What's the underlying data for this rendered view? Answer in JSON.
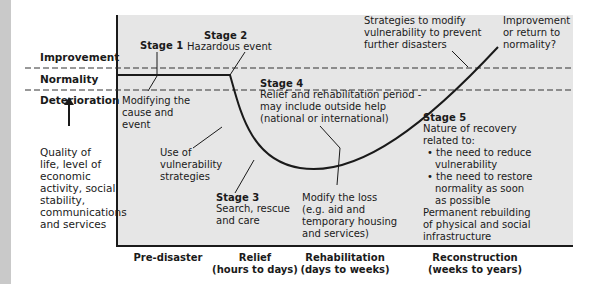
{
  "y_axis": {
    "bands": [
      "Improvement",
      "Normality",
      "Deterioration"
    ],
    "indicator_label": [
      "Quality of",
      "life, level of",
      "economic",
      "activity, social",
      "stability,",
      "communications",
      "and services"
    ]
  },
  "x_axis": {
    "phases": [
      {
        "name": "Pre-disaster",
        "span": ""
      },
      {
        "name": "Relief",
        "span": "(hours to days)"
      },
      {
        "name": "Rehabilitation",
        "span": "(days to weeks)"
      },
      {
        "name": "Reconstruction",
        "span": "(weeks to years)"
      }
    ]
  },
  "stages": {
    "stage1": {
      "title": "Stage 1",
      "text": [
        "Modifying the",
        "cause and",
        "event"
      ]
    },
    "stage2": {
      "title": "Stage 2",
      "text": [
        "Hazardous event"
      ]
    },
    "stage3": {
      "title": "Stage 3",
      "text": [
        "Search, rescue",
        "and care"
      ]
    },
    "stage4": {
      "title": "Stage 4",
      "text": [
        "Relief and rehabilitation period -",
        "may include outside help",
        "(national or international)"
      ]
    },
    "stage5": {
      "title": "Stage 5",
      "intro": [
        "Nature of recovery",
        "related to:"
      ],
      "bullets": [
        [
          "the need to reduce",
          "vulnerability"
        ],
        [
          "the need to restore",
          "normality as soon",
          "as possible"
        ]
      ],
      "outro": [
        "Permanent rebuilding",
        "of physical and social",
        "infrastructure"
      ]
    }
  },
  "annotations": {
    "vulnerability": [
      "Use of",
      "vulnerability",
      "strategies"
    ],
    "modify_loss": [
      "Modify the loss",
      "(e.g. aid and",
      "temporary housing",
      "and services)"
    ],
    "strategies": [
      "Strategies to modify",
      "vulnerability to prevent",
      "further disasters"
    ],
    "outcome": [
      "Improvement",
      "or return to",
      "normality?"
    ]
  },
  "colors": {
    "plot_bg": "#e6e6e6",
    "line": "#1a1a1a",
    "strip": "#c9c9c9"
  }
}
